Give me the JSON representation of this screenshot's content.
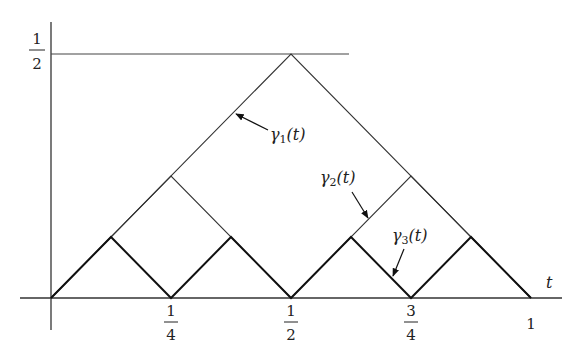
{
  "diagram": {
    "title": "",
    "axes": {
      "x_label": "t",
      "x_ticks": [
        {
          "num": "1",
          "den": "4",
          "t": 0.25
        },
        {
          "num": "1",
          "den": "2",
          "t": 0.5
        },
        {
          "num": "3",
          "den": "4",
          "t": 0.75
        },
        {
          "whole": "1",
          "t": 1.0
        }
      ],
      "y_ticks": [
        {
          "num": "1",
          "den": "2",
          "v": 0.5
        }
      ]
    },
    "curves": [
      {
        "name": "γ1(t)",
        "label_main": "γ",
        "label_sub": "1",
        "label_arg": "(t)",
        "points_t_v": [
          [
            0,
            0
          ],
          [
            0.5,
            0.5
          ],
          [
            1,
            0
          ]
        ],
        "stroke": "thin"
      },
      {
        "name": "γ2(t)",
        "label_main": "γ",
        "label_sub": "2",
        "label_arg": "(t)",
        "points_t_v": [
          [
            0,
            0
          ],
          [
            0.25,
            0.25
          ],
          [
            0.5,
            0
          ],
          [
            0.75,
            0.25
          ],
          [
            1,
            0
          ]
        ],
        "stroke": "thin"
      },
      {
        "name": "γ3(t)",
        "label_main": "γ",
        "label_sub": "3",
        "label_arg": "(t)",
        "points_t_v": [
          [
            0,
            0
          ],
          [
            0.125,
            0.125
          ],
          [
            0.25,
            0
          ],
          [
            0.375,
            0.125
          ],
          [
            0.5,
            0
          ],
          [
            0.625,
            0.125
          ],
          [
            0.75,
            0
          ],
          [
            0.875,
            0.125
          ],
          [
            1,
            0
          ]
        ],
        "stroke": "thick"
      }
    ],
    "reference_line": {
      "v": 0.5,
      "from_t": 0,
      "to_t": 0.62
    }
  }
}
